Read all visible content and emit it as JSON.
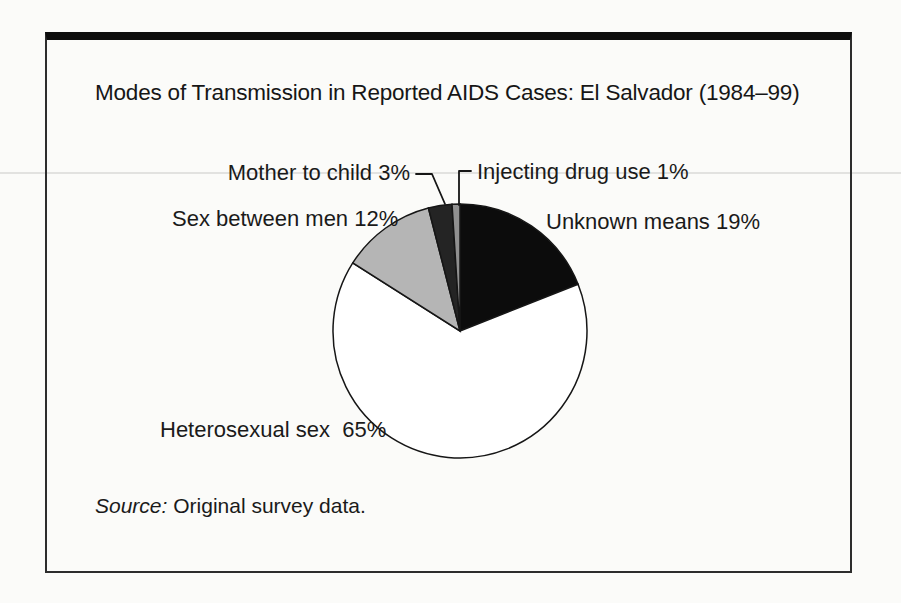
{
  "figure": {
    "title": "Modes of Transmission in Reported AIDS Cases: El Salvador (1984–99)",
    "labels": {
      "mother_to_child": "Mother to child 3%",
      "injecting_drug_use": "Injecting drug use 1%",
      "sex_between_men": "Sex between men 12%",
      "unknown_means": "Unknown means 19%",
      "heterosexual_sex": "Heterosexual sex  65%"
    },
    "source_prefix": "Source:",
    "source_text": "Original survey data."
  },
  "chart_data": {
    "type": "pie",
    "title": "Modes of Transmission in Reported AIDS Cases: El Salvador (1984–99)",
    "direction": "clockwise",
    "start_angle_deg": 0,
    "slices": [
      {
        "label": "Unknown means",
        "value_pct": 19,
        "color": "#0c0c0c"
      },
      {
        "label": "Heterosexual sex",
        "value_pct": 65,
        "color": "#ffffff"
      },
      {
        "label": "Sex between men",
        "value_pct": 12,
        "color": "#b5b5b5"
      },
      {
        "label": "Mother to child",
        "value_pct": 3,
        "color": "#242424"
      },
      {
        "label": "Injecting drug use",
        "value_pct": 1,
        "color": "#909090"
      }
    ],
    "stroke_color": "#161616",
    "source": "Source: Original survey data.",
    "legend_position": "none",
    "annotations": [
      "Mother to child 3%",
      "Injecting drug use 1%",
      "Sex between men 12%",
      "Unknown means 19%",
      "Heterosexual sex 65%"
    ]
  }
}
